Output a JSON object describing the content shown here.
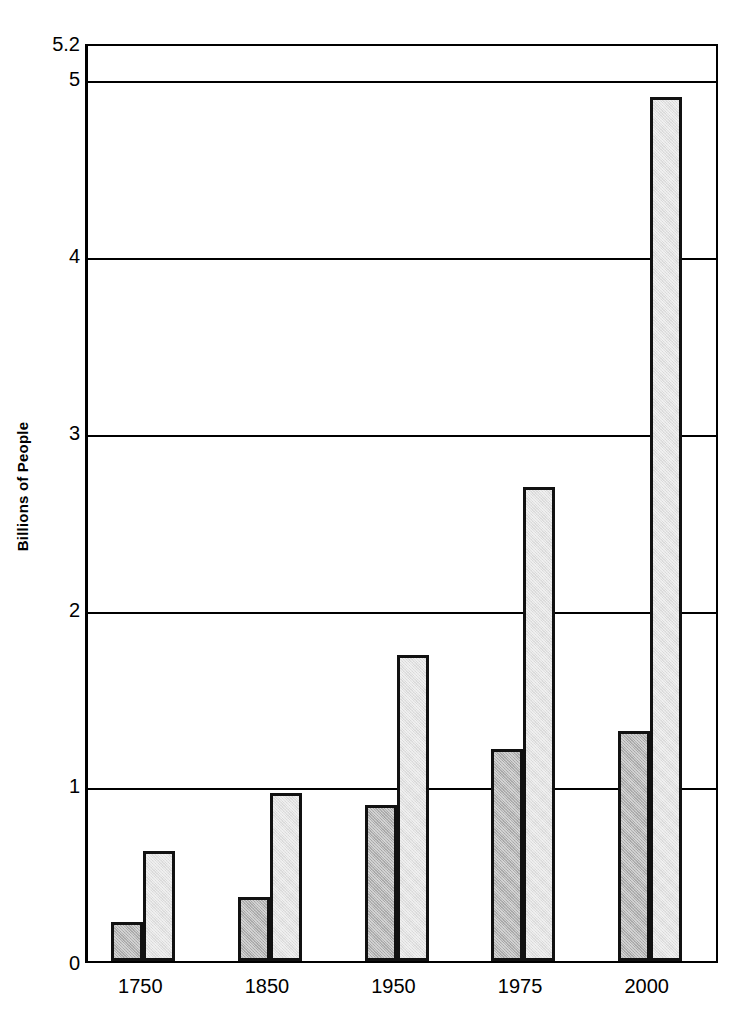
{
  "chart_data": {
    "type": "bar",
    "title": "",
    "subtitle": "",
    "xlabel": "",
    "ylabel": "Billions of People",
    "categories": [
      "1750",
      "1850",
      "1950",
      "1975",
      "2000"
    ],
    "series": [
      {
        "name": "series-a-dark",
        "color": "#b3b3b3",
        "values": [
          0.22,
          0.36,
          0.88,
          1.2,
          1.3
        ]
      },
      {
        "name": "series-b-light",
        "color": "#e2e2e2",
        "values": [
          0.62,
          0.95,
          1.73,
          2.68,
          4.89
        ]
      }
    ],
    "ylim": [
      0,
      5.2
    ],
    "yticks": [
      0,
      1,
      2,
      3,
      4,
      5,
      5.2
    ],
    "ytick_labels": [
      "0",
      "1",
      "2",
      "3",
      "4",
      "5",
      "5.2"
    ],
    "gridlines_at": [
      1,
      2,
      3,
      4,
      5
    ],
    "grid": true,
    "legend": "none",
    "bar_border_color": "#111111",
    "axis_color": "#000000",
    "background": "#ffffff"
  }
}
